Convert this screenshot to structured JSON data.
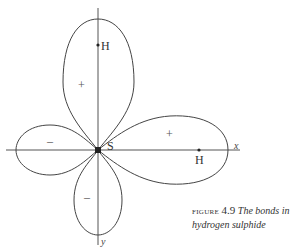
{
  "diagram": {
    "labels": {
      "top_atom": "H",
      "right_atom": "H",
      "center_atom": "S",
      "x_axis": "x",
      "y_axis": "y"
    },
    "signs": {
      "top_lobe": "+",
      "right_lobe": "+",
      "left_lobe": "–",
      "bottom_lobe": "–"
    },
    "colors": {
      "line": "#444444",
      "background": "#ffffff"
    }
  },
  "caption": {
    "figure_word": "figure",
    "figure_number": "4.9",
    "text_line1": "The bonds in",
    "text_line2": "hydrogen sulphide"
  }
}
